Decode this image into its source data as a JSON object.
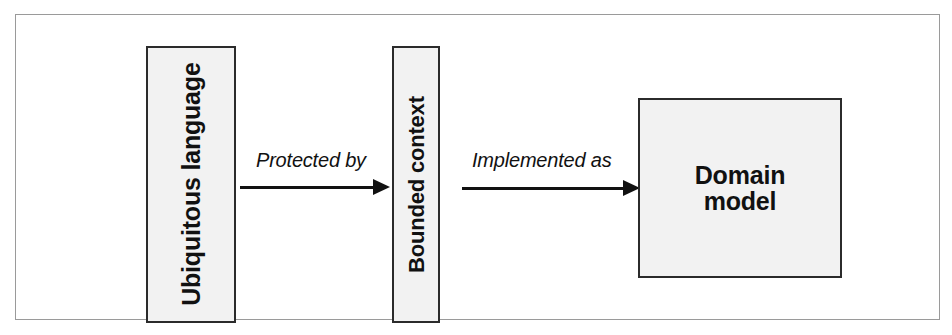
{
  "figure": {
    "background_color": "#ffffff",
    "frame_border_color": "#9a9a9a",
    "node_fill_color": "#f2f2f2",
    "node_border_color": "#2b2b2b",
    "ink_color": "#111111"
  },
  "diagram": {
    "type": "flow",
    "nodes": [
      {
        "id": "ubiquitous-language",
        "label": "Ubiquitous language",
        "orientation": "vertical"
      },
      {
        "id": "bounded-context",
        "label": "Bounded context",
        "orientation": "vertical"
      },
      {
        "id": "domain-model",
        "label": "Domain\nmodel",
        "label_line_1": "Domain",
        "label_line_2": "model",
        "orientation": "horizontal"
      }
    ],
    "edges": [
      {
        "id": "protected-by",
        "label": "Protected by",
        "from": "ubiquitous-language",
        "to": "bounded-context",
        "direction": "right"
      },
      {
        "id": "implemented-as",
        "label": "Implemented as",
        "from": "bounded-context",
        "to": "domain-model",
        "direction": "right"
      }
    ]
  }
}
